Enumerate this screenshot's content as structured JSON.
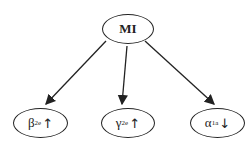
{
  "diagram": {
    "root": {
      "label": "MI"
    },
    "children": [
      {
        "symbol": "β",
        "subscript": "2e",
        "direction": "↑",
        "meaning": "increase"
      },
      {
        "symbol": "γ",
        "subscript": "2e",
        "direction": "↑",
        "meaning": "increase"
      },
      {
        "symbol": "α",
        "subscript": "1a",
        "direction": "↓",
        "meaning": "decrease"
      }
    ],
    "edges": [
      {
        "from": "MI",
        "to": "β2e"
      },
      {
        "from": "MI",
        "to": "γ2e"
      },
      {
        "from": "MI",
        "to": "α1a"
      }
    ]
  }
}
